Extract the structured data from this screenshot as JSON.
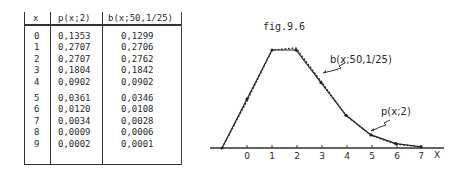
{
  "table": {
    "headers": {
      "x": "x",
      "poisson": "p(x;2)",
      "binomial": "b(x;50,1/25)"
    },
    "rows": [
      {
        "x": "0",
        "p": "0,1353",
        "b": "0,1299"
      },
      {
        "x": "1",
        "p": "0,2707",
        "b": "0,2706"
      },
      {
        "x": "2",
        "p": "0,2707",
        "b": "0,2762"
      },
      {
        "x": "3",
        "p": "0,1804",
        "b": "0,1842"
      },
      {
        "x": "4",
        "p": "0,0902",
        "b": "0,0902"
      },
      {
        "x": "5",
        "p": "0,0361",
        "b": "0,0346"
      },
      {
        "x": "6",
        "p": "0,0120",
        "b": "0,0108"
      },
      {
        "x": "7",
        "p": "0,0034",
        "b": "0,0028"
      },
      {
        "x": "8",
        "p": "0,0009",
        "b": "0,0006"
      },
      {
        "x": "9",
        "p": "0,0002",
        "b": "0,0001"
      }
    ]
  },
  "figure": {
    "caption": "fig.9.6",
    "label_binomial": "b(x;50,1/25)",
    "label_poisson": "p(x;2)",
    "x_axis_label": "X",
    "ticks": [
      "0",
      "1",
      "2",
      "3",
      "4",
      "5",
      "6",
      "7"
    ]
  },
  "chart_data": {
    "type": "line",
    "title": "fig.9.6",
    "xlabel": "X",
    "ylabel": "",
    "x": [
      0,
      1,
      2,
      3,
      4,
      5,
      6,
      7,
      8,
      9
    ],
    "series": [
      {
        "name": "p(x;2)",
        "style": "solid",
        "values": [
          0.1353,
          0.2707,
          0.2707,
          0.1804,
          0.0902,
          0.0361,
          0.012,
          0.0034,
          0.0009,
          0.0002
        ]
      },
      {
        "name": "b(x;50,1/25)",
        "style": "dashed",
        "values": [
          0.1299,
          0.2706,
          0.2762,
          0.1842,
          0.0902,
          0.0346,
          0.0108,
          0.0028,
          0.0006,
          0.0001
        ]
      }
    ],
    "x_ticks": [
      "0",
      "1",
      "2",
      "3",
      "4",
      "5",
      "6",
      "7"
    ],
    "grid": false,
    "legend": "inline annotations"
  }
}
